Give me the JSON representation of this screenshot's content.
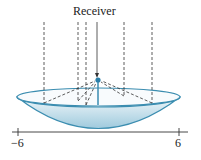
{
  "diagram": {
    "title_label": "Receiver",
    "axis": {
      "min_label": "−6",
      "max_label": "6"
    },
    "colors": {
      "dish": "#3b8db0",
      "dish_fill_top": "#eaf4f8",
      "dish_fill_bottom": "#a8cfe0",
      "dashes": "#333333"
    }
  }
}
